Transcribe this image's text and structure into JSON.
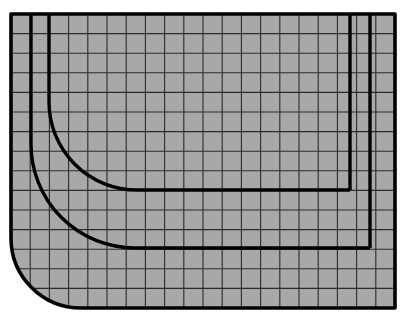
{
  "figure": {
    "type": "technical-line-drawing",
    "canvas": {
      "width": 406,
      "height": 320
    },
    "background_color": "#ffffff",
    "fill_color": "#a8a8a8",
    "line_color": "#000000",
    "grid_line_color": "#1a1a1a"
  },
  "chart_data": {
    "type": "diagram",
    "xlabel": "",
    "ylabel": "",
    "grid": true,
    "legend": "none",
    "xlim": [
      11,
      395
    ],
    "ylim": [
      14,
      308
    ],
    "grid_spec": {
      "x_start": 11,
      "x_end": 395,
      "y_start": 14,
      "y_end": 308,
      "cell_width": 19.2,
      "cell_height": 19.6,
      "columns": 20,
      "rows": 15,
      "minor_line_width": 1.1,
      "minor_line_color": "#1a1a1a"
    },
    "paths": [
      {
        "name": "outer-boundary",
        "stroke_width": 3.6,
        "corner_radius": 70,
        "rounded_corner": "bottom-left",
        "points": [
          [
            11,
            14
          ],
          [
            395,
            14
          ],
          [
            395,
            308
          ],
          [
            81,
            308
          ]
        ],
        "closed": false
      },
      {
        "name": "middle-curve",
        "stroke_width": 3.4,
        "corner_radius": 104,
        "rounded_corner": "bottom-left",
        "start": [
          31,
          14
        ],
        "end": [
          370,
          248
        ],
        "vertex": [
          31,
          248
        ]
      },
      {
        "name": "inner-curve",
        "stroke_width": 3.4,
        "corner_radius": 88,
        "rounded_corner": "bottom-left",
        "start": [
          49,
          14
        ],
        "end": [
          350,
          190
        ],
        "vertex": [
          49,
          190
        ]
      },
      {
        "name": "right-thick-vertical-outer",
        "stroke_width": 3.4,
        "points": [
          [
            370,
            14
          ],
          [
            370,
            248
          ]
        ]
      },
      {
        "name": "right-thick-vertical-inner",
        "stroke_width": 3.4,
        "points": [
          [
            350,
            14
          ],
          [
            350,
            190
          ]
        ]
      }
    ]
  }
}
